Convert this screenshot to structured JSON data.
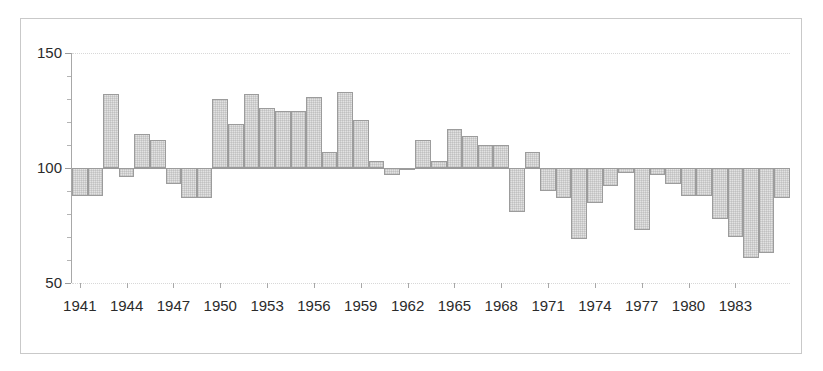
{
  "chart_data": {
    "type": "bar",
    "title": "",
    "subtitle": "",
    "xlabel": "",
    "ylabel": "",
    "ylim": [
      50,
      150
    ],
    "xlim": [
      1940.5,
      1986.5
    ],
    "grid": true,
    "gridlines": [
      50,
      150
    ],
    "baseline": 100,
    "legend": null,
    "legend_position": "none",
    "y_ticks_major": [
      50,
      100,
      150
    ],
    "y_tick_labels": [
      "50",
      "100",
      "150"
    ],
    "y_ticks_minor": [
      60,
      70,
      80,
      90,
      110,
      120,
      130,
      140
    ],
    "x_tick_labels": [
      "1941",
      "1944",
      "1947",
      "1950",
      "1953",
      "1956",
      "1959",
      "1962",
      "1965",
      "1968",
      "1971",
      "1974",
      "1977",
      "1980",
      "1983"
    ],
    "x_tick_years": [
      1941,
      1944,
      1947,
      1950,
      1953,
      1956,
      1959,
      1962,
      1965,
      1968,
      1971,
      1974,
      1977,
      1980,
      1983
    ],
    "bar_color": "#e2e2e2",
    "bar_edge_color": "#9c9c9c",
    "categories": [
      1941,
      1942,
      1943,
      1944,
      1945,
      1946,
      1947,
      1948,
      1949,
      1950,
      1951,
      1952,
      1953,
      1954,
      1955,
      1956,
      1957,
      1958,
      1959,
      1960,
      1961,
      1962,
      1963,
      1964,
      1965,
      1966,
      1967,
      1968,
      1969,
      1970,
      1971,
      1972,
      1973,
      1974,
      1975,
      1976,
      1977,
      1978,
      1979,
      1980,
      1981,
      1982,
      1983,
      1984,
      1985,
      1986
    ],
    "values": [
      88,
      88,
      132,
      96,
      115,
      112,
      93,
      87,
      87,
      130,
      119,
      132,
      126,
      125,
      125,
      131,
      107,
      133,
      121,
      103,
      97,
      100,
      112,
      103,
      117,
      114,
      110,
      110,
      81,
      107,
      90,
      87,
      69,
      85,
      92,
      98,
      73,
      97,
      93,
      88,
      88,
      78,
      70,
      61,
      63,
      87
    ]
  }
}
